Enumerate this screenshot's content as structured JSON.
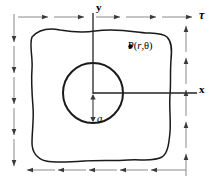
{
  "figure": {
    "background_color": "#ffffff",
    "line_color": "#1a1a1a",
    "arrow_color": "#555555",
    "axis_color": "#222222"
  },
  "labels": {
    "y_axis": "y",
    "x_axis": "x",
    "shear_stress": "τ",
    "hole_radius": "a",
    "point_prefix": "P(",
    "point_r": "r",
    "point_comma": ",",
    "point_theta": "θ",
    "point_suffix": ")",
    "point_full": "•P(r,θ)"
  },
  "geometry": {
    "hole": {
      "center_x": 93,
      "center_y": 93,
      "radius": 30,
      "radius_symbol": "a"
    },
    "origin": {
      "x": 93,
      "y": 93
    },
    "axes": {
      "y_line": {
        "x": 93,
        "y_top": 13,
        "y_bottom": 93
      },
      "x_line": {
        "y": 93,
        "x_left": 93,
        "x_right": 196
      }
    },
    "point_P": {
      "marker_x": 131,
      "marker_y": 47
    }
  },
  "loads": {
    "top": {
      "direction": "right",
      "label": "τ",
      "arrow_count": 5,
      "y": 17,
      "x_positions": [
        30,
        66,
        102,
        138,
        174
      ]
    },
    "bottom": {
      "direction": "left",
      "label": "τ",
      "arrow_count": 5,
      "y": 170,
      "x_positions": [
        66,
        97,
        128,
        159,
        190
      ]
    },
    "left": {
      "direction": "down",
      "label": "τ",
      "arrow_count": 5,
      "x": 14,
      "y_positions": [
        31,
        62,
        93,
        124,
        155
      ]
    },
    "right": {
      "direction": "up",
      "label": "τ",
      "arrow_count": 5,
      "x": 186,
      "y_positions": [
        30,
        62,
        94,
        126,
        158
      ]
    }
  },
  "outline": {
    "shape": "irregular-wavy-quadrilateral",
    "path": "M 31,38 C 38,29 48,28 58,30 C 70,32 82,33 95,31 C 108,29 122,30 136,32 C 150,34 160,33 167,36 C 173,39 174,48 173,58 C 172,70 173,82 172,95 C 171,108 173,120 172,132 C 171,143 170,152 165,156 C 157,161 144,159 131,160 C 116,161 100,160 85,161 C 70,162 55,163 44,161 C 35,159 30,152 30,142 C 30,130 32,118 31,106 C 30,93 29,80 30,68 C 31,56 28,46 31,38 Z"
  }
}
